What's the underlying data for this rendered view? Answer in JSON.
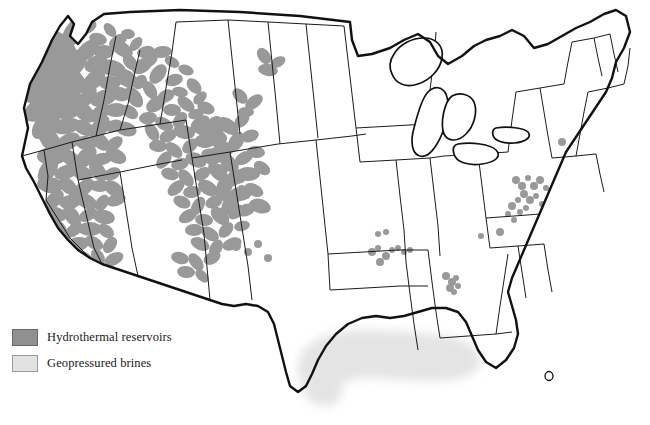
{
  "figure": {
    "name": "us-geothermal-resources-map",
    "width": 650,
    "height": 425,
    "background": "#ffffff"
  },
  "legend": {
    "items": [
      {
        "label": "Hydrothermal reservoirs",
        "color": "#909090",
        "border": "#6a6a6a",
        "key": "hydrothermal"
      },
      {
        "label": "Geopressured brines",
        "color": "#e2e2e2",
        "border": "#9a9a9a",
        "key": "geopressured"
      }
    ]
  },
  "styles": {
    "national_border": "#111111",
    "state_border": "#1b1b1b",
    "land_fill": "#ffffff",
    "hydrothermal_fill": "#999999",
    "geopressured_fill": "#e4e4e4",
    "lake_fill": "#ffffff"
  },
  "map_content": {
    "region": "Contiguous United States",
    "geopressured_zone": "Gulf Coast crescent from south Texas through Louisiana and Mississippi",
    "hydrothermal_zones": "Dense coverage across Oregon, Nevada, Idaho, western Montana, Wyoming, Utah, Colorado, California, Arizona, New Mexico; isolated clusters in west Texas, Arkansas, Georgia, the Virginia and West Virginia border, New York and Pennsylvania"
  },
  "hydrothermal_blobs": [
    [
      73,
      33,
      17,
      9
    ],
    [
      86,
      27,
      11,
      7
    ],
    [
      98,
      39,
      9,
      6
    ],
    [
      110,
      30,
      8,
      5
    ],
    [
      118,
      41,
      10,
      6
    ],
    [
      128,
      34,
      7,
      5
    ],
    [
      60,
      46,
      22,
      11
    ],
    [
      88,
      50,
      14,
      8
    ],
    [
      104,
      52,
      10,
      7
    ],
    [
      122,
      49,
      12,
      7
    ],
    [
      136,
      44,
      8,
      5
    ],
    [
      146,
      52,
      9,
      6
    ],
    [
      52,
      60,
      20,
      12
    ],
    [
      76,
      63,
      16,
      9
    ],
    [
      96,
      64,
      12,
      8
    ],
    [
      112,
      68,
      14,
      8
    ],
    [
      130,
      62,
      9,
      6
    ],
    [
      142,
      66,
      11,
      7
    ],
    [
      46,
      76,
      24,
      13
    ],
    [
      72,
      79,
      18,
      10
    ],
    [
      94,
      80,
      13,
      8
    ],
    [
      110,
      83,
      11,
      7
    ],
    [
      126,
      78,
      13,
      8
    ],
    [
      140,
      82,
      8,
      6
    ],
    [
      44,
      92,
      22,
      12
    ],
    [
      68,
      95,
      16,
      9
    ],
    [
      88,
      96,
      12,
      7
    ],
    [
      104,
      98,
      14,
      8
    ],
    [
      120,
      94,
      10,
      7
    ],
    [
      134,
      97,
      12,
      7
    ],
    [
      42,
      108,
      20,
      11
    ],
    [
      64,
      110,
      15,
      9
    ],
    [
      84,
      112,
      13,
      8
    ],
    [
      100,
      113,
      12,
      7
    ],
    [
      116,
      110,
      11,
      7
    ],
    [
      130,
      112,
      9,
      6
    ],
    [
      46,
      124,
      18,
      10
    ],
    [
      66,
      126,
      14,
      8
    ],
    [
      84,
      128,
      12,
      7
    ],
    [
      100,
      127,
      13,
      8
    ],
    [
      114,
      126,
      9,
      6
    ],
    [
      126,
      129,
      11,
      7
    ],
    [
      50,
      140,
      16,
      9
    ],
    [
      68,
      142,
      13,
      8
    ],
    [
      86,
      143,
      11,
      7
    ],
    [
      100,
      141,
      12,
      7
    ],
    [
      114,
      144,
      10,
      6
    ],
    [
      52,
      156,
      15,
      9
    ],
    [
      70,
      158,
      12,
      7
    ],
    [
      86,
      157,
      13,
      8
    ],
    [
      102,
      159,
      10,
      6
    ],
    [
      116,
      156,
      11,
      7
    ],
    [
      48,
      170,
      14,
      8
    ],
    [
      66,
      172,
      12,
      7
    ],
    [
      82,
      173,
      11,
      7
    ],
    [
      98,
      171,
      12,
      7
    ],
    [
      112,
      174,
      9,
      6
    ],
    [
      50,
      185,
      13,
      8
    ],
    [
      68,
      186,
      11,
      7
    ],
    [
      84,
      188,
      12,
      7
    ],
    [
      100,
      186,
      10,
      6
    ],
    [
      114,
      189,
      11,
      7
    ],
    [
      54,
      200,
      12,
      7
    ],
    [
      70,
      202,
      11,
      7
    ],
    [
      86,
      201,
      12,
      7
    ],
    [
      102,
      203,
      9,
      6
    ],
    [
      116,
      200,
      10,
      6
    ],
    [
      56,
      214,
      11,
      7
    ],
    [
      72,
      216,
      12,
      7
    ],
    [
      88,
      215,
      10,
      6
    ],
    [
      104,
      217,
      11,
      7
    ],
    [
      58,
      228,
      11,
      7
    ],
    [
      74,
      230,
      10,
      6
    ],
    [
      90,
      229,
      12,
      7
    ],
    [
      106,
      231,
      9,
      6
    ],
    [
      62,
      242,
      10,
      6
    ],
    [
      78,
      244,
      11,
      7
    ],
    [
      94,
      243,
      10,
      6
    ],
    [
      110,
      245,
      9,
      6
    ],
    [
      66,
      256,
      10,
      6
    ],
    [
      82,
      258,
      11,
      7
    ],
    [
      98,
      257,
      9,
      6
    ],
    [
      114,
      259,
      10,
      6
    ],
    [
      72,
      270,
      9,
      6
    ],
    [
      88,
      272,
      10,
      6
    ],
    [
      104,
      271,
      9,
      6
    ],
    [
      96,
      284,
      9,
      6
    ],
    [
      112,
      286,
      8,
      5
    ],
    [
      150,
      60,
      9,
      6
    ],
    [
      162,
      52,
      10,
      6
    ],
    [
      172,
      62,
      8,
      5
    ],
    [
      158,
      74,
      11,
      7
    ],
    [
      174,
      80,
      9,
      6
    ],
    [
      186,
      70,
      8,
      5
    ],
    [
      150,
      90,
      10,
      6
    ],
    [
      166,
      96,
      9,
      6
    ],
    [
      180,
      92,
      8,
      5
    ],
    [
      194,
      86,
      9,
      6
    ],
    [
      156,
      104,
      11,
      7
    ],
    [
      172,
      110,
      9,
      6
    ],
    [
      186,
      104,
      10,
      6
    ],
    [
      200,
      98,
      8,
      5
    ],
    [
      148,
      118,
      9,
      6
    ],
    [
      164,
      124,
      10,
      6
    ],
    [
      180,
      120,
      9,
      6
    ],
    [
      196,
      114,
      8,
      5
    ],
    [
      206,
      108,
      9,
      6
    ],
    [
      152,
      132,
      10,
      6
    ],
    [
      168,
      136,
      9,
      6
    ],
    [
      184,
      132,
      11,
      7
    ],
    [
      200,
      128,
      9,
      6
    ],
    [
      214,
      122,
      8,
      5
    ],
    [
      158,
      146,
      9,
      6
    ],
    [
      174,
      150,
      10,
      6
    ],
    [
      190,
      146,
      9,
      6
    ],
    [
      206,
      142,
      10,
      6
    ],
    [
      220,
      136,
      8,
      5
    ],
    [
      164,
      160,
      10,
      6
    ],
    [
      180,
      164,
      9,
      6
    ],
    [
      196,
      160,
      11,
      7
    ],
    [
      212,
      156,
      9,
      6
    ],
    [
      226,
      150,
      9,
      6
    ],
    [
      170,
      174,
      9,
      6
    ],
    [
      186,
      178,
      10,
      6
    ],
    [
      202,
      174,
      9,
      6
    ],
    [
      218,
      170,
      10,
      6
    ],
    [
      232,
      164,
      8,
      5
    ],
    [
      176,
      188,
      10,
      6
    ],
    [
      192,
      192,
      9,
      6
    ],
    [
      208,
      188,
      11,
      7
    ],
    [
      224,
      184,
      9,
      6
    ],
    [
      238,
      178,
      9,
      6
    ],
    [
      182,
      202,
      9,
      6
    ],
    [
      198,
      206,
      10,
      6
    ],
    [
      214,
      202,
      9,
      6
    ],
    [
      230,
      198,
      10,
      6
    ],
    [
      244,
      192,
      8,
      5
    ],
    [
      188,
      216,
      10,
      6
    ],
    [
      204,
      220,
      9,
      6
    ],
    [
      220,
      216,
      11,
      7
    ],
    [
      236,
      212,
      9,
      6
    ],
    [
      194,
      230,
      9,
      6
    ],
    [
      210,
      234,
      10,
      6
    ],
    [
      226,
      230,
      9,
      6
    ],
    [
      242,
      226,
      8,
      5
    ],
    [
      200,
      244,
      10,
      6
    ],
    [
      216,
      248,
      9,
      6
    ],
    [
      232,
      244,
      10,
      6
    ],
    [
      180,
      258,
      9,
      6
    ],
    [
      196,
      262,
      10,
      6
    ],
    [
      212,
      258,
      9,
      6
    ],
    [
      186,
      272,
      9,
      6
    ],
    [
      202,
      276,
      8,
      5
    ],
    [
      200,
      124,
      11,
      7
    ],
    [
      214,
      130,
      10,
      6
    ],
    [
      228,
      126,
      12,
      7
    ],
    [
      242,
      120,
      9,
      6
    ],
    [
      206,
      140,
      12,
      7
    ],
    [
      222,
      146,
      10,
      6
    ],
    [
      236,
      142,
      11,
      7
    ],
    [
      250,
      136,
      9,
      6
    ],
    [
      212,
      156,
      11,
      7
    ],
    [
      228,
      162,
      12,
      7
    ],
    [
      244,
      158,
      10,
      6
    ],
    [
      256,
      152,
      9,
      6
    ],
    [
      218,
      172,
      12,
      7
    ],
    [
      234,
      178,
      11,
      7
    ],
    [
      248,
      174,
      12,
      7
    ],
    [
      262,
      168,
      9,
      6
    ],
    [
      224,
      188,
      11,
      7
    ],
    [
      240,
      194,
      12,
      7
    ],
    [
      254,
      190,
      10,
      6
    ],
    [
      230,
      204,
      12,
      7
    ],
    [
      246,
      210,
      10,
      6
    ],
    [
      260,
      206,
      11,
      7
    ],
    [
      264,
      56,
      9,
      6
    ],
    [
      278,
      62,
      8,
      5
    ],
    [
      268,
      70,
      10,
      6
    ],
    [
      240,
      96,
      9,
      6
    ],
    [
      254,
      102,
      10,
      6
    ],
    [
      246,
      112,
      8,
      5
    ]
  ],
  "hydrothermal_dots": [
    [
      236,
      246,
      5
    ],
    [
      248,
      252,
      4
    ],
    [
      258,
      244,
      4
    ],
    [
      268,
      258,
      4
    ],
    [
      372,
      252,
      4
    ],
    [
      378,
      248,
      3
    ],
    [
      386,
      256,
      4
    ],
    [
      380,
      262,
      4
    ],
    [
      392,
      250,
      3
    ],
    [
      398,
      248,
      3
    ],
    [
      404,
      252,
      3
    ],
    [
      410,
      250,
      3
    ],
    [
      378,
      234,
      3
    ],
    [
      386,
      232,
      3
    ],
    [
      481,
      236,
      3
    ],
    [
      446,
      276,
      4
    ],
    [
      452,
      282,
      4
    ],
    [
      450,
      288,
      4
    ],
    [
      456,
      278,
      3
    ],
    [
      458,
      286,
      3
    ],
    [
      454,
      292,
      3
    ],
    [
      516,
      180,
      4
    ],
    [
      522,
      186,
      4
    ],
    [
      528,
      178,
      3
    ],
    [
      534,
      186,
      4
    ],
    [
      540,
      180,
      4
    ],
    [
      546,
      188,
      3
    ],
    [
      524,
      194,
      4
    ],
    [
      530,
      200,
      4
    ],
    [
      536,
      196,
      3
    ],
    [
      542,
      204,
      3
    ],
    [
      518,
      200,
      3
    ],
    [
      512,
      206,
      4
    ],
    [
      520,
      212,
      3
    ],
    [
      526,
      208,
      3
    ],
    [
      508,
      214,
      3
    ],
    [
      514,
      220,
      3
    ],
    [
      500,
      232,
      4
    ],
    [
      562,
      142,
      4
    ],
    [
      584,
      170,
      3
    ],
    [
      232,
      326,
      3
    ]
  ],
  "texas_blob": {
    "label": "trans-pecos-hydrothermal",
    "points": "234,318 240,312 248,313 252,320 250,330 244,338 238,344 232,340 229,332 230,324"
  },
  "geopressured_path": {
    "label": "gulf-coast-geopressured-brines"
  }
}
